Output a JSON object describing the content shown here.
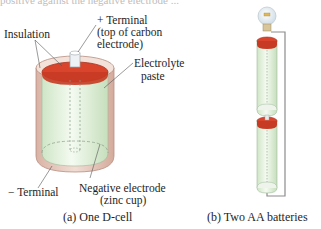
{
  "figure": {
    "top_fragment": "positive against the negative electrode ...",
    "panel_a": {
      "caption": "(a) One D-cell",
      "labels": {
        "insulation": "Insulation",
        "plus_terminal_line1": "+ Terminal",
        "plus_terminal_line2": "(top of carbon",
        "plus_terminal_line3": "electrode)",
        "electrolyte_line1": "Electrolyte",
        "electrolyte_line2": "paste",
        "minus_terminal": "− Terminal",
        "negative_electrode_line1": "Negative electrode",
        "negative_electrode_line2": "(zinc cup)"
      }
    },
    "panel_b": {
      "caption": "(b) Two AA batteries"
    },
    "colors": {
      "terminal_top": "#d9452c",
      "cell_body": "#dcefd6",
      "insulation": "#e8c9bc",
      "wire": "#888888",
      "bulb": "#e9f1f6"
    }
  }
}
